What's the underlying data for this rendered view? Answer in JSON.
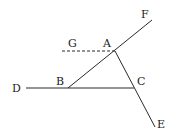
{
  "diagram": {
    "type": "geometry-figure",
    "background": "#ffffff",
    "line_color": "#2a2a2a",
    "points": {
      "A": {
        "label": "A",
        "x": 115,
        "y": 51
      },
      "B": {
        "label": "B",
        "x": 68,
        "y": 88
      },
      "C": {
        "label": "C",
        "x": 134,
        "y": 88
      },
      "D": {
        "label": "D",
        "x": 26,
        "y": 88
      },
      "E": {
        "label": "E",
        "x": 155,
        "y": 127
      },
      "F": {
        "label": "F",
        "x": 152,
        "y": 20
      },
      "G": {
        "label": "G",
        "x": 62,
        "y": 51
      }
    },
    "segments": [
      {
        "from": "B",
        "to": "F",
        "style": "solid",
        "description": "line BA extended to F"
      },
      {
        "from": "A",
        "to": "E",
        "style": "solid",
        "description": "line AC extended to E"
      },
      {
        "from": "D",
        "to": "C",
        "style": "solid",
        "description": "line DB extended to C"
      },
      {
        "from": "G",
        "to": "A",
        "style": "dashed",
        "description": "dashed line GA parallel to DC"
      }
    ]
  }
}
